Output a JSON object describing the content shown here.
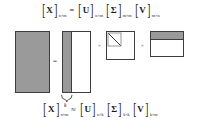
{
  "figure": {
    "background_color": "#ffffff",
    "fill_color": "#9a9a9a",
    "border_color": "#3d3d3d"
  },
  "equation_top": {
    "terms": [
      {
        "symbol": "X",
        "subscript": "n×m"
      },
      {
        "symbol": "U",
        "subscript": "n×m"
      },
      {
        "symbol": "Σ",
        "subscript": "m×m"
      },
      {
        "symbol": "V",
        "subscript": "m×n"
      }
    ],
    "relation": "=",
    "bracket_left": "[",
    "bracket_right": "]"
  },
  "equation_bottom": {
    "terms": [
      {
        "symbol": "X",
        "subscript": "n×m"
      },
      {
        "symbol": "U",
        "subscript": "n×k"
      },
      {
        "symbol": "Σ",
        "subscript": "k×k"
      },
      {
        "symbol": "V",
        "subscript": "k×m"
      }
    ],
    "relation": "≈",
    "bracket_left": "[",
    "bracket_right": "]"
  },
  "matrices": {
    "x": {
      "name": "X",
      "fill": "solid-gray"
    },
    "u": {
      "name": "U",
      "fill": "left-strip-gray"
    },
    "sigma": {
      "name": "Σ",
      "fill": "diagonal-top-left"
    },
    "v": {
      "name": "V",
      "fill": "top-strip-gray"
    }
  },
  "operators": {
    "equals": "=",
    "times_1": "×",
    "times_2": "×"
  },
  "annotations": {
    "rank_label": "k"
  }
}
